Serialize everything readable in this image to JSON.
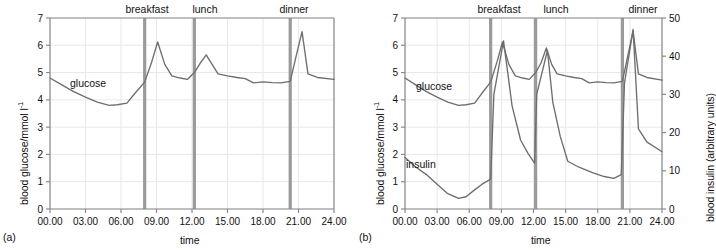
{
  "figure": {
    "panels": [
      {
        "tag": "(a)",
        "xlabel": "time",
        "ylabel_main": "blood glucose/mmol l",
        "ylabel_exp": "-1",
        "series_labels": {
          "glucose": "glucose"
        },
        "meal_labels": {
          "breakfast": "breakfast",
          "lunch": "lunch",
          "dinner": "dinner"
        }
      },
      {
        "tag": "(b)",
        "xlabel": "time",
        "ylabel_main": "blood glucose/mmol l",
        "ylabel_exp": "-1",
        "ylabel_right": "blood insulin (arbitrary units)",
        "series_labels": {
          "glucose": "glucose",
          "insulin": "insulin"
        },
        "meal_labels": {
          "breakfast": "breakfast",
          "lunch": "lunch",
          "dinner": "dinner"
        }
      }
    ]
  },
  "colors": {
    "curve": "#6e6e6e",
    "meal_marker": "#9a9a9a",
    "grid": "#e8e8e8",
    "axis": "#8a8a8a",
    "text": "#111111",
    "background": "#ffffff"
  },
  "chart_data": [
    {
      "type": "line",
      "title": "",
      "panel": "(a)",
      "xlabel": "time",
      "ylabel": "blood glucose/mmol l-1",
      "xlim": [
        0,
        24
      ],
      "ylim": [
        0,
        7
      ],
      "xtick_labels": [
        "00.00",
        "03.00",
        "06.00",
        "09.00",
        "12.00",
        "15.00",
        "18.00",
        "21.00",
        "24.00"
      ],
      "xticks": [
        0,
        3,
        6,
        9,
        12,
        15,
        18,
        21,
        24
      ],
      "yticks": [
        0,
        1,
        2,
        3,
        4,
        5,
        6,
        7
      ],
      "grid": true,
      "legend": "inline-labels",
      "annotations": [
        {
          "label": "breakfast",
          "x": 8.0,
          "type": "vertical-marker"
        },
        {
          "label": "lunch",
          "x": 12.2,
          "type": "vertical-marker"
        },
        {
          "label": "dinner",
          "x": 20.3,
          "type": "vertical-marker"
        }
      ],
      "series": [
        {
          "name": "glucose",
          "unit": "mmol l-1",
          "axis": "left",
          "x": [
            0,
            1,
            2,
            3,
            4,
            5,
            5.7,
            6.5,
            7.2,
            8.0,
            8.6,
            9.1,
            9.7,
            10.3,
            11.0,
            11.6,
            12.2,
            12.7,
            13.2,
            13.7,
            14.2,
            15.0,
            15.8,
            16.5,
            17.2,
            18.0,
            18.8,
            19.5,
            20.3,
            20.8,
            21.3,
            21.8,
            22.6,
            24.0
          ],
          "y": [
            4.8,
            4.55,
            4.3,
            4.1,
            3.92,
            3.8,
            3.82,
            3.88,
            4.25,
            4.65,
            5.4,
            6.12,
            5.3,
            4.88,
            4.8,
            4.75,
            5.0,
            5.35,
            5.65,
            5.3,
            4.95,
            4.88,
            4.82,
            4.78,
            4.62,
            4.66,
            4.63,
            4.62,
            4.68,
            5.6,
            6.5,
            4.95,
            4.82,
            4.75
          ]
        }
      ]
    },
    {
      "type": "line",
      "title": "",
      "panel": "(b)",
      "xlabel": "time",
      "ylabel": "blood glucose/mmol l-1",
      "ylabel_right": "blood insulin (arbitrary units)",
      "xlim": [
        0,
        24
      ],
      "ylim": [
        0,
        7
      ],
      "ylim_right": [
        0,
        50
      ],
      "xtick_labels": [
        "00.00",
        "03.00",
        "06.00",
        "09.00",
        "12.00",
        "15.00",
        "18.00",
        "21.00",
        "24.00"
      ],
      "xticks": [
        0,
        3,
        6,
        9,
        12,
        15,
        18,
        21,
        24
      ],
      "yticks": [
        0,
        1,
        2,
        3,
        4,
        5,
        6,
        7
      ],
      "yticks_right": [
        0,
        10,
        20,
        30,
        40,
        50
      ],
      "grid": true,
      "legend": "inline-labels",
      "annotations": [
        {
          "label": "breakfast",
          "x": 8.0,
          "type": "vertical-marker"
        },
        {
          "label": "lunch",
          "x": 12.2,
          "type": "vertical-marker"
        },
        {
          "label": "dinner",
          "x": 20.3,
          "type": "vertical-marker"
        }
      ],
      "series": [
        {
          "name": "glucose",
          "unit": "mmol l-1",
          "axis": "left",
          "x": [
            0,
            1,
            2,
            3,
            4,
            5,
            5.7,
            6.5,
            7.2,
            8.0,
            8.6,
            9.1,
            9.7,
            10.3,
            11.0,
            11.6,
            12.2,
            12.7,
            13.2,
            13.7,
            14.2,
            15.0,
            15.8,
            16.5,
            17.2,
            18.0,
            18.8,
            19.5,
            20.3,
            20.8,
            21.3,
            21.8,
            22.6,
            24.0
          ],
          "y": [
            4.8,
            4.55,
            4.3,
            4.1,
            3.92,
            3.8,
            3.82,
            3.88,
            4.25,
            4.65,
            5.4,
            6.12,
            5.3,
            4.88,
            4.8,
            4.75,
            5.0,
            5.35,
            5.9,
            5.3,
            4.95,
            4.88,
            4.82,
            4.78,
            4.62,
            4.66,
            4.63,
            4.62,
            4.68,
            5.6,
            6.52,
            4.95,
            4.82,
            4.72
          ]
        },
        {
          "name": "insulin",
          "unit": "arbitrary units",
          "axis": "right",
          "x": [
            0,
            1,
            2,
            3,
            4,
            5,
            5.7,
            6.5,
            7.2,
            8.0,
            8.3,
            9.2,
            10.0,
            10.8,
            11.5,
            12.1,
            12.3,
            13.3,
            13.8,
            14.5,
            15.2,
            16.2,
            17.5,
            18.6,
            19.5,
            20.2,
            20.5,
            21.3,
            21.8,
            22.6,
            24.0
          ],
          "y": [
            13.5,
            11.0,
            9.0,
            6.5,
            4.0,
            2.8,
            3.2,
            5.0,
            6.5,
            7.8,
            30.0,
            44.0,
            27.0,
            18.0,
            14.5,
            12.0,
            30.0,
            41.5,
            28.0,
            19.0,
            12.5,
            11.0,
            9.5,
            8.5,
            8.0,
            9.0,
            33.0,
            47.0,
            21.0,
            17.5,
            15.0
          ]
        }
      ]
    }
  ]
}
